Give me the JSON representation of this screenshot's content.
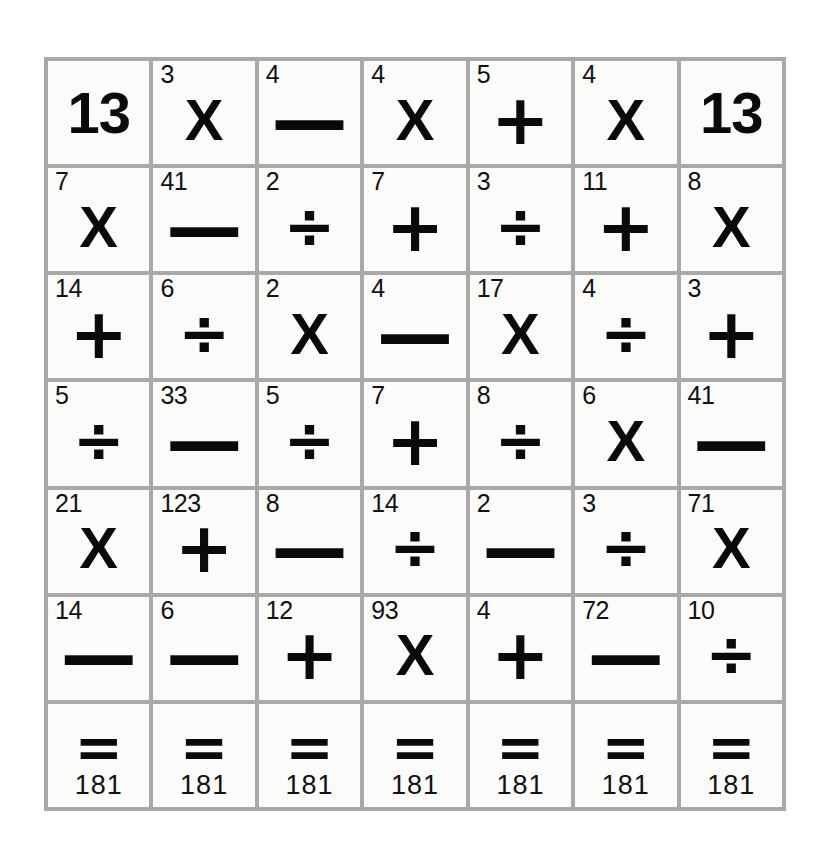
{
  "puzzle": {
    "kind": "arithmetic-grid",
    "columns": 7,
    "rows": 7,
    "colors": {
      "page_background": "#ffffff",
      "cell_background": "#fbfbf9",
      "grid_line": "#a9a9a7",
      "ink": "#0a0a0a"
    },
    "glyphs": {
      "times": "X",
      "minus": "—",
      "plus": "+",
      "divide": "÷",
      "equals": "="
    },
    "target_value": "13",
    "result_value": "181",
    "grid": [
      [
        {
          "type": "target",
          "value": "13"
        },
        {
          "type": "term",
          "operand": "3",
          "operator": "X",
          "op_name": "times"
        },
        {
          "type": "term",
          "operand": "4",
          "operator": "—",
          "op_name": "minus"
        },
        {
          "type": "term",
          "operand": "4",
          "operator": "X",
          "op_name": "times"
        },
        {
          "type": "term",
          "operand": "5",
          "operator": "+",
          "op_name": "plus"
        },
        {
          "type": "term",
          "operand": "4",
          "operator": "X",
          "op_name": "times"
        },
        {
          "type": "target",
          "value": "13"
        }
      ],
      [
        {
          "type": "term",
          "operand": "7",
          "operator": "X",
          "op_name": "times"
        },
        {
          "type": "term",
          "operand": "41",
          "operator": "—",
          "op_name": "minus"
        },
        {
          "type": "term",
          "operand": "2",
          "operator": "÷",
          "op_name": "divide"
        },
        {
          "type": "term",
          "operand": "7",
          "operator": "+",
          "op_name": "plus"
        },
        {
          "type": "term",
          "operand": "3",
          "operator": "÷",
          "op_name": "divide"
        },
        {
          "type": "term",
          "operand": "11",
          "operator": "+",
          "op_name": "plus"
        },
        {
          "type": "term",
          "operand": "8",
          "operator": "X",
          "op_name": "times"
        }
      ],
      [
        {
          "type": "term",
          "operand": "14",
          "operator": "+",
          "op_name": "plus"
        },
        {
          "type": "term",
          "operand": "6",
          "operator": "÷",
          "op_name": "divide"
        },
        {
          "type": "term",
          "operand": "2",
          "operator": "X",
          "op_name": "times"
        },
        {
          "type": "term",
          "operand": "4",
          "operator": "—",
          "op_name": "minus"
        },
        {
          "type": "term",
          "operand": "17",
          "operator": "X",
          "op_name": "times"
        },
        {
          "type": "term",
          "operand": "4",
          "operator": "÷",
          "op_name": "divide"
        },
        {
          "type": "term",
          "operand": "3",
          "operator": "+",
          "op_name": "plus"
        }
      ],
      [
        {
          "type": "term",
          "operand": "5",
          "operator": "÷",
          "op_name": "divide"
        },
        {
          "type": "term",
          "operand": "33",
          "operator": "—",
          "op_name": "minus"
        },
        {
          "type": "term",
          "operand": "5",
          "operator": "÷",
          "op_name": "divide"
        },
        {
          "type": "term",
          "operand": "7",
          "operator": "+",
          "op_name": "plus"
        },
        {
          "type": "term",
          "operand": "8",
          "operator": "÷",
          "op_name": "divide"
        },
        {
          "type": "term",
          "operand": "6",
          "operator": "X",
          "op_name": "times"
        },
        {
          "type": "term",
          "operand": "41",
          "operator": "—",
          "op_name": "minus"
        }
      ],
      [
        {
          "type": "term",
          "operand": "21",
          "operator": "X",
          "op_name": "times"
        },
        {
          "type": "term",
          "operand": "123",
          "operator": "+",
          "op_name": "plus"
        },
        {
          "type": "term",
          "operand": "8",
          "operator": "—",
          "op_name": "minus"
        },
        {
          "type": "term",
          "operand": "14",
          "operator": "÷",
          "op_name": "divide"
        },
        {
          "type": "term",
          "operand": "2",
          "operator": "—",
          "op_name": "minus"
        },
        {
          "type": "term",
          "operand": "3",
          "operator": "÷",
          "op_name": "divide"
        },
        {
          "type": "term",
          "operand": "71",
          "operator": "X",
          "op_name": "times"
        }
      ],
      [
        {
          "type": "term",
          "operand": "14",
          "operator": "—",
          "op_name": "minus"
        },
        {
          "type": "term",
          "operand": "6",
          "operator": "—",
          "op_name": "minus"
        },
        {
          "type": "term",
          "operand": "12",
          "operator": "+",
          "op_name": "plus"
        },
        {
          "type": "term",
          "operand": "93",
          "operator": "X",
          "op_name": "times"
        },
        {
          "type": "term",
          "operand": "4",
          "operator": "+",
          "op_name": "plus"
        },
        {
          "type": "term",
          "operand": "72",
          "operator": "—",
          "op_name": "minus"
        },
        {
          "type": "term",
          "operand": "10",
          "operator": "÷",
          "op_name": "divide"
        }
      ],
      [
        {
          "type": "result",
          "equals": "=",
          "total": "181"
        },
        {
          "type": "result",
          "equals": "=",
          "total": "181"
        },
        {
          "type": "result",
          "equals": "=",
          "total": "181"
        },
        {
          "type": "result",
          "equals": "=",
          "total": "181"
        },
        {
          "type": "result",
          "equals": "=",
          "total": "181"
        },
        {
          "type": "result",
          "equals": "=",
          "total": "181"
        },
        {
          "type": "result",
          "equals": "=",
          "total": "181"
        }
      ]
    ]
  }
}
